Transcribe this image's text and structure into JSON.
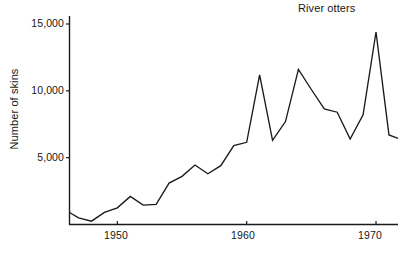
{
  "chart_data": {
    "type": "line",
    "title": "River otters",
    "xlabel": "",
    "ylabel": "Number of skins",
    "xlim": [
      1946.3,
      1971.7
    ],
    "ylim": [
      0,
      15800
    ],
    "grid": false,
    "legend": null,
    "x_ticks": [
      1950,
      1960,
      1970
    ],
    "x_tick_labels": [
      "1950",
      "1960",
      "1970"
    ],
    "y_ticks": [
      5000,
      10000,
      15000
    ],
    "y_tick_labels": [
      "5,000",
      "10,000",
      "15,000"
    ],
    "series": [
      {
        "name": "River otters",
        "color": "#1a1a1a",
        "x": [
          1946.3,
          1947.0,
          1948.0,
          1949.0,
          1950.0,
          1951.0,
          1952.0,
          1953.0,
          1954.0,
          1955.0,
          1956.0,
          1957.0,
          1958.0,
          1959.0,
          1960.0,
          1961.0,
          1962.0,
          1963.0,
          1964.0,
          1965.0,
          1966.0,
          1967.0,
          1968.0,
          1969.0,
          1970.0,
          1971.0,
          1971.7
        ],
        "values": [
          900,
          500,
          250,
          900,
          1250,
          2100,
          1450,
          1500,
          3100,
          3600,
          4450,
          3800,
          4400,
          5900,
          6150,
          11200,
          6300,
          7700,
          11600,
          10100,
          8650,
          8400,
          6400,
          8200,
          14400,
          6700,
          6450
        ]
      }
    ]
  },
  "axis": {
    "y_axis_name": "y-axis",
    "x_axis_name": "x-axis"
  }
}
